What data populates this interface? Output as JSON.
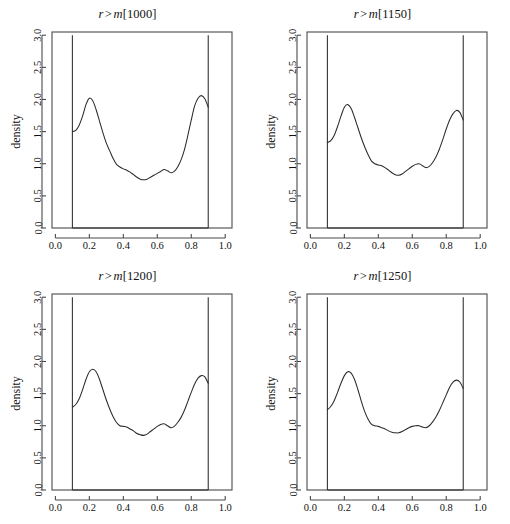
{
  "figure": {
    "layout": "2x2 grid of density plots",
    "panel_count": 4
  },
  "panels": [
    {
      "title_var": "r",
      "title_rel": ">",
      "title_fn": "m",
      "title_index": "[1000]",
      "title_full": "r > m[1000]",
      "ylabel": "density"
    },
    {
      "title_var": "r",
      "title_rel": ">",
      "title_fn": "m",
      "title_index": "[1150]",
      "title_full": "r > m[1150]",
      "ylabel": "density"
    },
    {
      "title_var": "r",
      "title_rel": ">",
      "title_fn": "m",
      "title_index": "[1200]",
      "title_full": "r > m[1200]",
      "ylabel": "density"
    },
    {
      "title_var": "r",
      "title_rel": ">",
      "title_fn": "m",
      "title_index": "[1250]",
      "title_full": "r > m[1250]",
      "ylabel": "density"
    }
  ],
  "axes": {
    "xticks": [
      "0.0",
      "0.2",
      "0.4",
      "0.6",
      "0.8",
      "1.0"
    ],
    "xtick_values": [
      0.0,
      0.2,
      0.4,
      0.6,
      0.8,
      1.0
    ],
    "yticks": [
      "0.0",
      "0.5",
      "1.0",
      "1.5",
      "2.0",
      "2.5",
      "3.0"
    ],
    "ytick_values": [
      0.0,
      0.5,
      1.0,
      1.5,
      2.0,
      2.5,
      3.0
    ],
    "xlim": [
      -0.02,
      1.04
    ],
    "ylim": [
      0.0,
      3.05
    ],
    "xlabel": "",
    "ylabel": "density",
    "grid": false
  },
  "chart_data": {
    "type": "line",
    "xlabel": "",
    "ylabel": "density",
    "xlim": [
      -0.02,
      1.04
    ],
    "ylim": [
      0.0,
      3.05
    ],
    "grid": false,
    "legend": "none",
    "xticks": [
      0.0,
      0.2,
      0.4,
      0.6,
      0.8,
      1.0
    ],
    "yticks": [
      0.0,
      0.5,
      1.0,
      1.5,
      2.0,
      2.5,
      3.0
    ],
    "support": [
      0.1,
      0.9
    ],
    "boundary_spikes": {
      "left_x": 0.1,
      "right_x": 0.9,
      "from_y": 0.0,
      "to_y": 3.0,
      "baseline_y": 0.0,
      "note": "vertical truncation bars at the support boundaries joined by a zero baseline"
    },
    "panels": [
      {
        "name": "r > m[1000]",
        "x": [
          0.1,
          0.12,
          0.14,
          0.16,
          0.18,
          0.2,
          0.22,
          0.24,
          0.26,
          0.28,
          0.3,
          0.32,
          0.34,
          0.36,
          0.38,
          0.4,
          0.42,
          0.44,
          0.46,
          0.48,
          0.5,
          0.52,
          0.54,
          0.56,
          0.58,
          0.6,
          0.62,
          0.64,
          0.66,
          0.68,
          0.7,
          0.72,
          0.74,
          0.76,
          0.78,
          0.8,
          0.82,
          0.84,
          0.86,
          0.88,
          0.9
        ],
        "values": [
          1.5,
          1.52,
          1.6,
          1.74,
          1.92,
          2.02,
          1.98,
          1.84,
          1.66,
          1.48,
          1.32,
          1.2,
          1.08,
          0.99,
          0.95,
          0.92,
          0.9,
          0.87,
          0.83,
          0.79,
          0.76,
          0.75,
          0.76,
          0.79,
          0.82,
          0.85,
          0.88,
          0.91,
          0.89,
          0.86,
          0.88,
          0.95,
          1.06,
          1.22,
          1.44,
          1.68,
          1.9,
          2.02,
          2.06,
          2.01,
          1.88
        ]
      },
      {
        "name": "r > m[1150]",
        "x": [
          0.1,
          0.12,
          0.14,
          0.16,
          0.18,
          0.2,
          0.22,
          0.24,
          0.26,
          0.28,
          0.3,
          0.32,
          0.34,
          0.36,
          0.38,
          0.4,
          0.42,
          0.44,
          0.46,
          0.48,
          0.5,
          0.52,
          0.54,
          0.56,
          0.58,
          0.6,
          0.62,
          0.64,
          0.66,
          0.68,
          0.7,
          0.72,
          0.74,
          0.76,
          0.78,
          0.8,
          0.82,
          0.84,
          0.86,
          0.88,
          0.9
        ],
        "values": [
          1.33,
          1.36,
          1.44,
          1.58,
          1.74,
          1.88,
          1.92,
          1.86,
          1.72,
          1.56,
          1.4,
          1.26,
          1.14,
          1.04,
          1.0,
          0.98,
          0.97,
          0.94,
          0.9,
          0.86,
          0.83,
          0.82,
          0.84,
          0.88,
          0.92,
          0.96,
          0.99,
          1.0,
          0.97,
          0.94,
          0.96,
          1.02,
          1.11,
          1.23,
          1.38,
          1.54,
          1.68,
          1.78,
          1.83,
          1.8,
          1.68
        ]
      },
      {
        "name": "r > m[1200]",
        "x": [
          0.1,
          0.12,
          0.14,
          0.16,
          0.18,
          0.2,
          0.22,
          0.24,
          0.26,
          0.28,
          0.3,
          0.32,
          0.34,
          0.36,
          0.38,
          0.4,
          0.42,
          0.44,
          0.46,
          0.48,
          0.5,
          0.52,
          0.54,
          0.56,
          0.58,
          0.6,
          0.62,
          0.64,
          0.66,
          0.68,
          0.7,
          0.72,
          0.74,
          0.76,
          0.78,
          0.8,
          0.82,
          0.84,
          0.86,
          0.88,
          0.9
        ],
        "values": [
          1.29,
          1.33,
          1.42,
          1.56,
          1.72,
          1.84,
          1.88,
          1.84,
          1.72,
          1.56,
          1.4,
          1.26,
          1.14,
          1.05,
          1.0,
          0.99,
          0.98,
          0.95,
          0.92,
          0.88,
          0.86,
          0.85,
          0.87,
          0.91,
          0.95,
          0.99,
          1.02,
          1.03,
          1.0,
          0.97,
          0.99,
          1.05,
          1.13,
          1.24,
          1.38,
          1.52,
          1.65,
          1.74,
          1.78,
          1.76,
          1.66
        ]
      },
      {
        "name": "r > m[1250]",
        "x": [
          0.1,
          0.12,
          0.14,
          0.16,
          0.18,
          0.2,
          0.22,
          0.24,
          0.26,
          0.28,
          0.3,
          0.32,
          0.34,
          0.36,
          0.38,
          0.4,
          0.42,
          0.44,
          0.46,
          0.48,
          0.5,
          0.52,
          0.54,
          0.56,
          0.58,
          0.6,
          0.62,
          0.64,
          0.66,
          0.68,
          0.7,
          0.72,
          0.74,
          0.76,
          0.78,
          0.8,
          0.82,
          0.84,
          0.86,
          0.88,
          0.9
        ],
        "values": [
          1.25,
          1.3,
          1.39,
          1.52,
          1.66,
          1.78,
          1.84,
          1.82,
          1.72,
          1.56,
          1.38,
          1.22,
          1.1,
          1.02,
          1.0,
          0.99,
          0.97,
          0.95,
          0.92,
          0.9,
          0.89,
          0.89,
          0.91,
          0.94,
          0.97,
          0.99,
          1.0,
          1.0,
          0.98,
          0.97,
          1.0,
          1.06,
          1.14,
          1.24,
          1.36,
          1.48,
          1.6,
          1.68,
          1.71,
          1.68,
          1.58
        ]
      }
    ]
  },
  "colors": {
    "background": "#ffffff",
    "curve": "#2b2b2b",
    "axis": "#4a4a4a",
    "text": "#111111"
  }
}
